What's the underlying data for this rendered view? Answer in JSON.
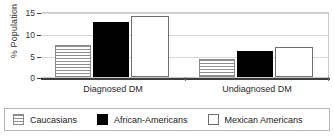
{
  "chart_data": {
    "type": "bar",
    "title": "",
    "xlabel": "",
    "ylabel": "% Population",
    "ylim": [
      0,
      15
    ],
    "yticks": [
      0,
      5,
      10,
      15
    ],
    "ytick_labels": [
      "0",
      "5",
      "10",
      "15"
    ],
    "grid": true,
    "legend_position": "bottom",
    "categories": [
      "Diagnosed DM",
      "Undiagnosed DM"
    ],
    "series": [
      {
        "name": "Caucasians",
        "fill": "hatched-horizontal",
        "color": "#ffffff",
        "values": [
          7.5,
          4.2
        ]
      },
      {
        "name": "African-Americans",
        "fill": "solid",
        "color": "#000000",
        "values": [
          12.8,
          6.0
        ]
      },
      {
        "name": "Mexican Americans",
        "fill": "open",
        "color": "#ffffff",
        "values": [
          14.0,
          6.9
        ]
      }
    ]
  },
  "axis": {
    "y_label": "% Population",
    "ticks": [
      {
        "value": 15,
        "label": "15"
      },
      {
        "value": 10,
        "label": "10"
      },
      {
        "value": 5,
        "label": "5"
      },
      {
        "value": 0,
        "label": "0"
      }
    ]
  },
  "categories": [
    {
      "label": "Diagnosed DM"
    },
    {
      "label": "Undiagnosed DM"
    }
  ],
  "legend": {
    "items": [
      {
        "label": "Caucasians",
        "swatch": "hatched-swatch"
      },
      {
        "label": "African-Americans",
        "swatch": "black-swatch"
      },
      {
        "label": "Mexican Americans",
        "swatch": "white-swatch"
      }
    ]
  }
}
